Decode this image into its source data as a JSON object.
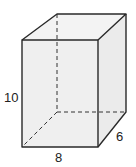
{
  "diagram": {
    "type": "rectangular-prism",
    "labels": {
      "height": "10",
      "width": "8",
      "depth": "6"
    },
    "colors": {
      "edge": "#2a2a2a",
      "face_fill": "#eeeeee",
      "background": "#ffffff"
    }
  }
}
